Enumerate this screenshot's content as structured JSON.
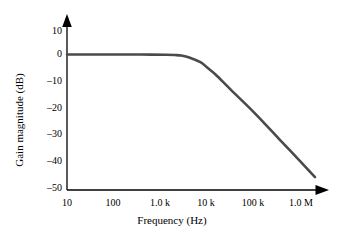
{
  "figure": {
    "background_color": "#ffffff",
    "curve_color": "#4a4a4a",
    "axis_color": "#000000"
  },
  "chart_data": {
    "type": "line",
    "title": "",
    "xlabel": "Frequency (Hz)",
    "ylabel": "Gain magnitude (dB)",
    "xscale": "log",
    "xlim": [
      10,
      1000000
    ],
    "ylim": [
      -50,
      10
    ],
    "yticks": [
      10,
      0,
      -10,
      -20,
      -30,
      -40,
      -50
    ],
    "ytick_labels": [
      "10",
      "0",
      "–10",
      "–20",
      "–30",
      "–40",
      "–50"
    ],
    "xticks": [
      10,
      100,
      1000,
      10000,
      100000,
      1000000
    ],
    "xtick_labels": [
      "10",
      "100",
      "1.0 k",
      "10 k",
      "100 k",
      "1.0 M"
    ],
    "grid": false,
    "legend": null,
    "annotations": [],
    "series": [
      {
        "name": "Gain magnitude",
        "corner_frequency_hz": 2000,
        "passband_gain_db": 0,
        "rolloff_db_per_decade": -20,
        "x": [
          10,
          20,
          50,
          100,
          200,
          500,
          1000,
          1500,
          2000,
          3000,
          5000,
          7000,
          10000,
          20000,
          50000,
          100000,
          200000,
          500000,
          1000000
        ],
        "y": [
          0,
          0,
          0,
          0,
          0,
          -0.03,
          -0.1,
          -0.2,
          -0.4,
          -1.2,
          -3.0,
          -5.2,
          -7.6,
          -13.2,
          -20.4,
          -26.2,
          -32.2,
          -40.0,
          -46.0
        ]
      }
    ]
  },
  "axis_labels": {
    "y": [
      "10",
      "0",
      "–10",
      "–20",
      "–30",
      "–40",
      "–50"
    ],
    "x": [
      "10",
      "100",
      "1.0 k",
      "10 k",
      "100 k",
      "1.0 M"
    ],
    "x_title": "Frequency (Hz)",
    "y_title": "Gain magnitude (dB)"
  }
}
